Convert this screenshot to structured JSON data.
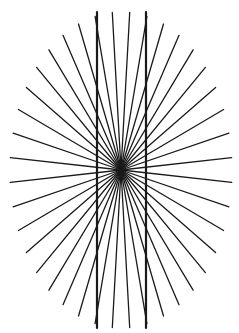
{
  "figure": {
    "title": "",
    "background": "#ffffff",
    "line_color": "#1a1a1a",
    "center": {
      "x": 121,
      "y": 170
    },
    "radius": {
      "rx": 111,
      "ry": 158
    },
    "ray_count": 40,
    "ray_width": 1.3,
    "vertical_lines": [
      {
        "x1": 97,
        "y1": 12,
        "x2": 97,
        "y2": 328
      },
      {
        "x1": 146,
        "y1": 12,
        "x2": 146,
        "y2": 328
      }
    ],
    "vertical_width": 2.2
  }
}
